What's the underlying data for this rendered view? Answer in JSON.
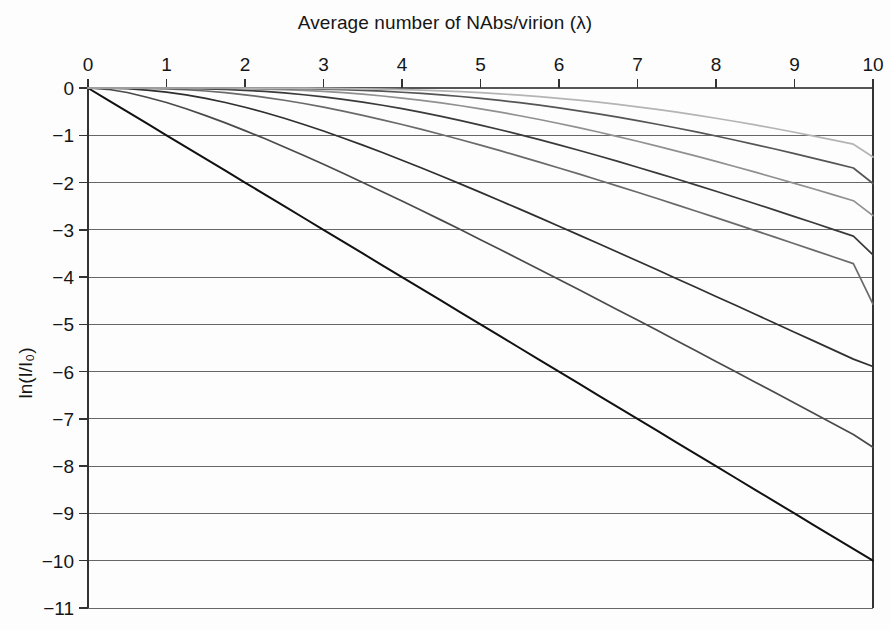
{
  "chart_data": {
    "type": "line",
    "title": "Average number of NAbs/virion (λ)",
    "title_plain": "Average number of NAbs/virion (lambda)",
    "xlabel": "Average number of NAbs/virion (λ)",
    "ylabel": "ln(I/I₀)",
    "xlim": [
      0,
      10
    ],
    "ylim": [
      -11,
      0
    ],
    "xticks": [
      0,
      1,
      2,
      3,
      4,
      5,
      6,
      7,
      8,
      9,
      10
    ],
    "xtick_labels": [
      "0",
      "1",
      "2",
      "3",
      "4",
      "5",
      "6",
      "7",
      "8",
      "9",
      "10"
    ],
    "yticks": [
      0,
      -1,
      -2,
      -3,
      -4,
      -5,
      -6,
      -7,
      -8,
      -9,
      -10,
      -11
    ],
    "ytick_labels": [
      "0",
      "−1",
      "−2",
      "−3",
      "−4",
      "−5",
      "−6",
      "−7",
      "−8",
      "−9",
      "−10",
      "−11"
    ],
    "grid": "horizontal",
    "grid_color": "#555555",
    "legend": "none",
    "axis_position": {
      "x_axis": "top",
      "y_axis": "left"
    },
    "x": [
      0,
      0.25,
      0.5,
      0.75,
      1,
      1.25,
      1.5,
      1.75,
      2,
      2.25,
      2.5,
      2.75,
      3,
      3.25,
      3.5,
      3.75,
      4,
      4.25,
      4.5,
      4.75,
      5,
      5.25,
      5.5,
      5.75,
      6,
      6.25,
      6.5,
      6.75,
      7,
      7.25,
      7.5,
      7.75,
      8,
      8.25,
      8.5,
      8.75,
      9,
      9.25,
      9.5,
      9.75,
      10
    ],
    "series": [
      {
        "name": "n = 1",
        "color": "#111111",
        "width": 2.0,
        "values": [
          0,
          -0.25,
          -0.5,
          -0.75,
          -1,
          -1.25,
          -1.5,
          -1.75,
          -2,
          -2.25,
          -2.5,
          -2.75,
          -3,
          -3.25,
          -3.5,
          -3.75,
          -4,
          -4.25,
          -4.5,
          -4.75,
          -5,
          -5.25,
          -5.5,
          -5.75,
          -6,
          -6.25,
          -6.5,
          -6.75,
          -7,
          -7.25,
          -7.5,
          -7.75,
          -8,
          -8.25,
          -8.5,
          -8.75,
          -9,
          -9.25,
          -9.5,
          -9.75,
          -10
        ],
        "endpoint": -10.0
      },
      {
        "name": "n = 2",
        "color": "#4a4a4a",
        "width": 1.7,
        "values": [
          0,
          -0.027,
          -0.095,
          -0.196,
          -0.307,
          -0.439,
          -0.584,
          -0.738,
          -0.901,
          -1.07,
          -1.247,
          -1.429,
          -1.614,
          -1.804,
          -1.997,
          -2.193,
          -2.391,
          -2.592,
          -2.795,
          -3.0,
          -3.208,
          -3.416,
          -3.626,
          -3.838,
          -4.05,
          -4.264,
          -4.478,
          -4.694,
          -4.91,
          -5.127,
          -5.345,
          -5.563,
          -5.783,
          -6.002,
          -6.222,
          -6.443,
          -6.664,
          -6.886,
          -7.108,
          -7.33,
          -7.602
        ],
        "endpoint": -7.6
      },
      {
        "name": "n = 3",
        "color": "#2f2f2f",
        "width": 1.7,
        "values": [
          0,
          -0.0025,
          -0.0154,
          -0.043,
          -0.0861,
          -0.145,
          -0.2187,
          -0.3065,
          -0.407,
          -0.5189,
          -0.6409,
          -0.772,
          -0.9109,
          -1.0567,
          -1.2086,
          -1.3656,
          -1.5272,
          -1.6927,
          -1.8616,
          -2.0334,
          -2.2078,
          -2.3843,
          -2.5627,
          -2.7427,
          -2.9241,
          -3.1067,
          -3.2904,
          -3.475,
          -3.6605,
          -3.8467,
          -4.0335,
          -4.2209,
          -4.4088,
          -4.5972,
          -4.786,
          -4.9752,
          -5.1647,
          -5.3546,
          -5.5448,
          -5.7352,
          -5.889
        ],
        "endpoint": -5.89
      },
      {
        "name": "n = 4",
        "color": "#6a6a6a",
        "width": 1.7,
        "values": [
          0,
          -0.0002,
          -0.0019,
          -0.0073,
          -0.0185,
          -0.0371,
          -0.0639,
          -0.0995,
          -0.1441,
          -0.1974,
          -0.259,
          -0.3285,
          -0.4052,
          -0.4886,
          -0.5779,
          -0.6726,
          -0.7721,
          -0.8759,
          -0.9836,
          -1.0947,
          -1.209,
          -1.3261,
          -1.4457,
          -1.5677,
          -1.6918,
          -1.8178,
          -1.9456,
          -2.075,
          -2.2059,
          -2.3381,
          -2.4716,
          -2.6063,
          -2.742,
          -2.8787,
          -3.0163,
          -3.1548,
          -3.294,
          -3.434,
          -3.5746,
          -3.7158,
          -4.5717
        ],
        "endpoint": -4.57
      },
      {
        "name": "n = 5",
        "color": "#3a3a3a",
        "width": 1.7,
        "values": [
          0,
          0,
          -0.0002,
          -0.001,
          -0.0034,
          -0.0083,
          -0.0167,
          -0.0298,
          -0.0483,
          -0.0729,
          -0.1042,
          -0.1424,
          -0.1877,
          -0.24,
          -0.2993,
          -0.3653,
          -0.4377,
          -0.5162,
          -0.6003,
          -0.6898,
          -0.7842,
          -0.8831,
          -0.9862,
          -1.0932,
          -1.2036,
          -1.3174,
          -1.4341,
          -1.5535,
          -1.6754,
          -1.7997,
          -1.926,
          -2.0543,
          -2.1844,
          -2.3161,
          -2.4493,
          -2.5839,
          -2.7198,
          -2.8569,
          -2.995,
          -3.1341,
          -3.53
        ],
        "endpoint": -3.53
      },
      {
        "name": "n = 6",
        "color": "#909090",
        "width": 1.7,
        "values": [
          0,
          0,
          0,
          -0.0001,
          -0.0005,
          -0.0015,
          -0.0035,
          -0.0072,
          -0.0132,
          -0.0222,
          -0.0348,
          -0.0516,
          -0.0731,
          -0.0996,
          -0.1315,
          -0.169,
          -0.2121,
          -0.2609,
          -0.3154,
          -0.3753,
          -0.4406,
          -0.511,
          -0.5863,
          -0.6662,
          -0.7505,
          -0.8389,
          -0.9312,
          -1.0271,
          -1.1264,
          -1.2288,
          -1.3341,
          -1.4422,
          -1.5528,
          -1.6657,
          -1.7809,
          -1.898,
          -2.017,
          -2.1377,
          -2.26,
          -2.3838,
          -2.704
        ],
        "endpoint": -2.7
      },
      {
        "name": "n = 7",
        "color": "#555555",
        "width": 1.7,
        "values": [
          0,
          0,
          0,
          0,
          -0.0001,
          -0.0002,
          -0.0006,
          -0.0015,
          -0.0031,
          -0.0058,
          -0.0099,
          -0.0159,
          -0.0243,
          -0.0354,
          -0.0497,
          -0.0676,
          -0.0894,
          -0.1152,
          -0.1454,
          -0.18,
          -0.2191,
          -0.2628,
          -0.311,
          -0.3637,
          -0.4207,
          -0.482,
          -0.5474,
          -0.6167,
          -0.6898,
          -0.7664,
          -0.8465,
          -0.9297,
          -1.016,
          -1.1051,
          -1.1969,
          -1.2913,
          -1.3881,
          -1.4871,
          -1.5883,
          -1.6915,
          -2.0222
        ],
        "endpoint": -2.02
      },
      {
        "name": "n = 8",
        "color": "#b4b4b4",
        "width": 1.7,
        "values": [
          0,
          0,
          0,
          0,
          0,
          0,
          -0.0001,
          -0.0003,
          -0.0006,
          -0.0013,
          -0.0025,
          -0.0043,
          -0.0071,
          -0.0112,
          -0.0167,
          -0.0241,
          -0.0336,
          -0.0455,
          -0.0602,
          -0.0779,
          -0.0988,
          -0.1231,
          -0.1511,
          -0.1827,
          -0.2182,
          -0.2575,
          -0.3008,
          -0.3479,
          -0.3989,
          -0.4537,
          -0.5122,
          -0.5744,
          -0.6401,
          -0.7092,
          -0.7816,
          -0.8572,
          -0.9358,
          -1.0174,
          -1.1017,
          -1.1887,
          -1.46
        ],
        "endpoint": -1.46
      }
    ]
  },
  "plot_geometry": {
    "left_px": 88,
    "right_px": 873,
    "top_px": 88,
    "bottom_px": 608
  }
}
